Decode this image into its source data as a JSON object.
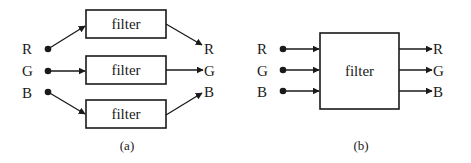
{
  "panel_a": {
    "caption": "(a)",
    "inputs": [
      "R",
      "G",
      "B"
    ],
    "outputs": [
      "R",
      "G",
      "B"
    ],
    "filters": [
      "filter",
      "filter",
      "filter"
    ]
  },
  "panel_b": {
    "caption": "(b)",
    "inputs": [
      "R",
      "G",
      "B"
    ],
    "outputs": [
      "R",
      "G",
      "B"
    ],
    "filter": "filter"
  },
  "colors": {
    "ink": "#1a1a1a",
    "background": "#ffffff"
  }
}
